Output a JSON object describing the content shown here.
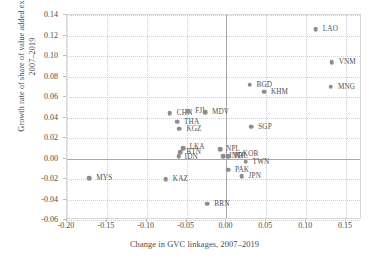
{
  "chart_data": {
    "type": "scatter",
    "title": "",
    "xlabel": "Change in GVC linkages, 2007–2019",
    "ylabel": "Growth rate of share of value added exports, 2007–2019",
    "xlim": [
      -0.2,
      0.17
    ],
    "ylim": [
      -0.06,
      0.14
    ],
    "xticks": [
      "-0.20",
      "-0.15",
      "-0.10",
      "-0.05",
      "0.00",
      "0.05",
      "0.10",
      "0.15"
    ],
    "xtick_values": [
      -0.2,
      -0.15,
      -0.1,
      -0.05,
      0.0,
      0.05,
      0.1,
      0.15
    ],
    "yticks": [
      "0.14",
      "0.12",
      "0.10",
      "0.08",
      "0.06",
      "0.04",
      "0.02",
      "0.00",
      "-0.02",
      "-0.04",
      "-0.06"
    ],
    "ytick_values": [
      0.14,
      0.12,
      0.1,
      0.08,
      0.06,
      0.04,
      0.02,
      0.0,
      -0.02,
      -0.04,
      -0.06
    ],
    "grid": true,
    "legend": "none",
    "marker_color": "#8d8d8d",
    "reference_lines": {
      "x": 0.0,
      "y": 0.0
    },
    "points": [
      {
        "label": "LAO",
        "x": 0.112,
        "y": 0.126,
        "lx": 7,
        "ly": 0
      },
      {
        "label": "VNM",
        "x": 0.132,
        "y": 0.094,
        "lx": 7,
        "ly": 0
      },
      {
        "label": "MNG",
        "x": 0.131,
        "y": 0.07,
        "lx": 7,
        "ly": 0
      },
      {
        "label": "BGD",
        "x": 0.029,
        "y": 0.072,
        "lx": 7,
        "ly": 0
      },
      {
        "label": "KHM",
        "x": 0.047,
        "y": 0.065,
        "lx": 7,
        "ly": 0
      },
      {
        "label": "SGP",
        "x": 0.031,
        "y": 0.031,
        "lx": 7,
        "ly": 0
      },
      {
        "label": "CHN",
        "x": -0.071,
        "y": 0.044,
        "lx": 7,
        "ly": 0
      },
      {
        "label": "FJI",
        "x": -0.048,
        "y": 0.046,
        "lx": 7,
        "ly": 0
      },
      {
        "label": "MDV",
        "x": -0.027,
        "y": 0.045,
        "lx": 7,
        "ly": 0
      },
      {
        "label": "THA",
        "x": -0.062,
        "y": 0.036,
        "lx": 7,
        "ly": 0
      },
      {
        "label": "KGZ",
        "x": -0.059,
        "y": 0.029,
        "lx": 7,
        "ly": 0
      },
      {
        "label": "LKA",
        "x": -0.054,
        "y": 0.01,
        "lx": 6,
        "ly": -1
      },
      {
        "label": "BTN",
        "x": -0.058,
        "y": 0.006,
        "lx": 6,
        "ly": 0
      },
      {
        "label": "IDN",
        "x": -0.06,
        "y": 0.002,
        "lx": 6,
        "ly": 1
      },
      {
        "label": "NPL",
        "x": -0.008,
        "y": 0.009,
        "lx": 6,
        "ly": 0
      },
      {
        "label": "IND",
        "x": -0.004,
        "y": 0.002,
        "lx": 6,
        "ly": 0
      },
      {
        "label": "PHL",
        "x": 0.002,
        "y": 0.002,
        "lx": 6,
        "ly": 0
      },
      {
        "label": "KOR",
        "x": 0.013,
        "y": 0.004,
        "lx": 6,
        "ly": 0
      },
      {
        "label": "TWN",
        "x": 0.024,
        "y": -0.003,
        "lx": 7,
        "ly": 0
      },
      {
        "label": "PAK",
        "x": 0.002,
        "y": -0.011,
        "lx": 7,
        "ly": 0
      },
      {
        "label": "JPN",
        "x": 0.019,
        "y": -0.017,
        "lx": 7,
        "ly": 0
      },
      {
        "label": "MYS",
        "x": -0.172,
        "y": -0.019,
        "lx": 7,
        "ly": 0
      },
      {
        "label": "KAZ",
        "x": -0.076,
        "y": -0.02,
        "lx": 7,
        "ly": 0
      },
      {
        "label": "BRN",
        "x": -0.024,
        "y": -0.044,
        "lx": 7,
        "ly": 0
      }
    ]
  }
}
